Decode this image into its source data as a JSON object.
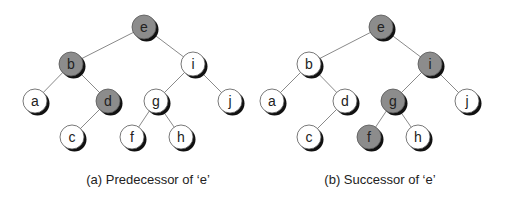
{
  "diagrams": [
    {
      "id": "a",
      "caption": "(a) Predecessor of ‘e’",
      "caption_x": 148,
      "highlighted": [
        "e",
        "b",
        "d"
      ],
      "nodes": [
        {
          "label": "e",
          "x": 144,
          "y": 27
        },
        {
          "label": "b",
          "x": 71,
          "y": 64
        },
        {
          "label": "i",
          "x": 193,
          "y": 64
        },
        {
          "label": "a",
          "x": 35,
          "y": 101
        },
        {
          "label": "d",
          "x": 108,
          "y": 101
        },
        {
          "label": "g",
          "x": 156,
          "y": 101
        },
        {
          "label": "j",
          "x": 230,
          "y": 101
        },
        {
          "label": "c",
          "x": 72,
          "y": 137
        },
        {
          "label": "f",
          "x": 132,
          "y": 137
        },
        {
          "label": "h",
          "x": 181,
          "y": 137
        }
      ],
      "edges": [
        [
          "e",
          "b"
        ],
        [
          "e",
          "i"
        ],
        [
          "b",
          "a"
        ],
        [
          "b",
          "d"
        ],
        [
          "d",
          "c"
        ],
        [
          "i",
          "g"
        ],
        [
          "i",
          "j"
        ],
        [
          "g",
          "f"
        ],
        [
          "g",
          "h"
        ]
      ]
    },
    {
      "id": "b",
      "caption": "(b) Successor of ‘e’",
      "caption_x": 380,
      "highlighted": [
        "e",
        "i",
        "g",
        "f"
      ],
      "nodes": [
        {
          "label": "e",
          "x": 381,
          "y": 27
        },
        {
          "label": "b",
          "x": 309,
          "y": 64
        },
        {
          "label": "i",
          "x": 430,
          "y": 64
        },
        {
          "label": "a",
          "x": 272,
          "y": 101
        },
        {
          "label": "d",
          "x": 345,
          "y": 101
        },
        {
          "label": "g",
          "x": 393,
          "y": 101
        },
        {
          "label": "j",
          "x": 467,
          "y": 101
        },
        {
          "label": "c",
          "x": 309,
          "y": 137
        },
        {
          "label": "f",
          "x": 369,
          "y": 137
        },
        {
          "label": "h",
          "x": 418,
          "y": 137
        }
      ],
      "edges": [
        [
          "e",
          "b"
        ],
        [
          "e",
          "i"
        ],
        [
          "b",
          "a"
        ],
        [
          "b",
          "d"
        ],
        [
          "d",
          "c"
        ],
        [
          "i",
          "g"
        ],
        [
          "i",
          "j"
        ],
        [
          "g",
          "f"
        ],
        [
          "g",
          "h"
        ]
      ]
    }
  ],
  "colors": {
    "highlight_fill": "#8c8c8c",
    "normal_fill": "#ffffff",
    "edge": "#8a8a8a",
    "shadow": "#111111"
  }
}
